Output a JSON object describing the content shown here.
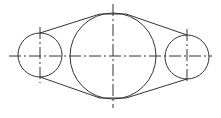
{
  "diagram": {
    "type": "technical-drawing",
    "title": "",
    "stroke_color": "#333333",
    "background": "#ffffff",
    "circles": [
      {
        "name": "left-small-circle",
        "cx": 40,
        "cy": 55,
        "r": 22
      },
      {
        "name": "large-center-circle",
        "cx": 113,
        "cy": 56,
        "r": 43
      },
      {
        "name": "right-small-circle",
        "cx": 187,
        "cy": 57,
        "r": 22
      }
    ],
    "tangent_lines": [
      {
        "name": "upper-left-tangent",
        "x1": 40,
        "y1": 33,
        "x2": 100,
        "y2": 14
      },
      {
        "name": "lower-left-tangent",
        "x1": 40,
        "y1": 77,
        "x2": 100,
        "y2": 98
      },
      {
        "name": "upper-right-tangent",
        "x1": 126,
        "y1": 14,
        "x2": 187,
        "y2": 35
      },
      {
        "name": "lower-right-tangent",
        "x1": 126,
        "y1": 98,
        "x2": 187,
        "y2": 79
      }
    ],
    "arc_tops": [
      {
        "name": "large-circle-top-flat",
        "x1": 100,
        "y1": 14,
        "x2": 126,
        "y2": 14
      },
      {
        "name": "large-circle-bottom-flat",
        "x1": 100,
        "y1": 98,
        "x2": 126,
        "y2": 98
      }
    ],
    "center_lines": [
      {
        "name": "horizontal-centerline",
        "x1": 9,
        "y1": 56,
        "x2": 212,
        "y2": 56
      },
      {
        "name": "large-vertical-centerline",
        "x1": 113,
        "y1": 4,
        "x2": 113,
        "y2": 108
      },
      {
        "name": "left-vertical-centerline",
        "x1": 40,
        "y1": 27,
        "x2": 40,
        "y2": 83
      },
      {
        "name": "right-vertical-centerline",
        "x1": 187,
        "y1": 29,
        "x2": 187,
        "y2": 84
      }
    ]
  }
}
